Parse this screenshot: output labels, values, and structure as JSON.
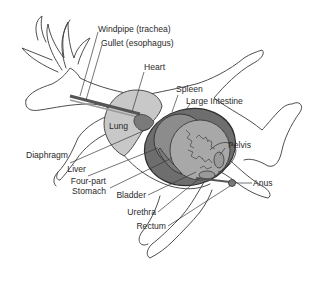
{
  "figure": {
    "colors": {
      "outline": "#3a3a3a",
      "lung_fill": "#c8c8c8",
      "stomach_outer": "#6e6e6e",
      "stomach_mid": "#8c8c8c",
      "intestine_fill": "#a8a8a8",
      "heart_fill": "#7a7a7a",
      "tube_fill": "#7a7a7a",
      "pelvis_fill": "#9a9a9a",
      "background": "#ffffff"
    }
  },
  "labels": {
    "windpipe": "Windpipe (trachea)",
    "gullet": "Gullet (esophagus)",
    "heart": "Heart",
    "spleen": "Spleen",
    "large_intestine": "Large Intestine",
    "lung": "Lung",
    "pelvis": "Pelvis",
    "diaphragm": "Diaphragm",
    "liver": "Liver",
    "four_part_line1": "Four-part",
    "four_part_line2": "Stomach",
    "anus": "Anus",
    "bladder": "Bladder",
    "urethra": "Urethra",
    "rectum": "Rectum"
  }
}
